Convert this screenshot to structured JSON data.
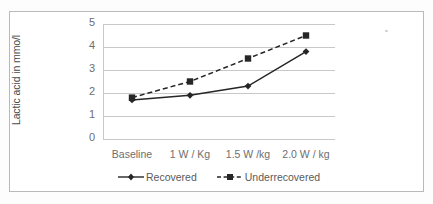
{
  "figure": {
    "background_color": "#ffffff",
    "frame_color": "#b9b9b9",
    "gridline_color": "#c8c8c8",
    "text_color": "#6e6e6e",
    "series_color": "#262626",
    "artifact": "scan-speck"
  },
  "chart_data": {
    "type": "line",
    "title": "",
    "xlabel": "",
    "ylabel": "Lactic acid in mmo/l",
    "categories": [
      "Baseline",
      "1 W / Kg",
      "1.5 W /kg",
      "2.0 W / kg"
    ],
    "ylim": [
      0,
      5
    ],
    "yticks": [
      0,
      1,
      2,
      3,
      4,
      5
    ],
    "ytick_labels": [
      "0",
      "1",
      "2",
      "3",
      "4",
      "5"
    ],
    "grid": true,
    "grid_axis": "y",
    "legend_position": "bottom",
    "series": [
      {
        "name": "Recovered",
        "values": [
          1.7,
          1.9,
          2.3,
          3.8
        ],
        "linestyle": "solid",
        "marker": "diamond",
        "color": "#262626"
      },
      {
        "name": "Underrecovered",
        "values": [
          1.8,
          2.5,
          3.5,
          4.5
        ],
        "linestyle": "dashed",
        "marker": "square",
        "color": "#262626"
      }
    ]
  },
  "legend": {
    "items": [
      {
        "label": "Recovered"
      },
      {
        "label": "Underrecovered"
      }
    ]
  }
}
